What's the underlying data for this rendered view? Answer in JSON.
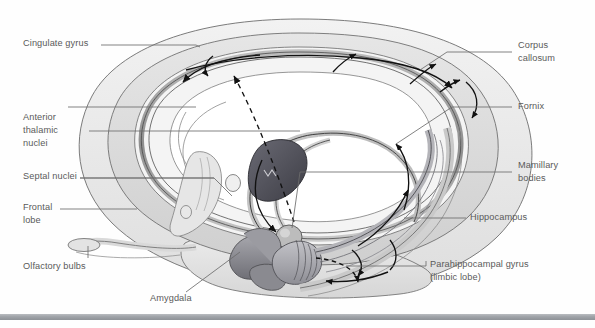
{
  "figure": {
    "background_color": "#fefefe",
    "ink_color": "#5a5a5a",
    "bottom_bar_color": "#9fa3a8"
  },
  "labels": {
    "cingulate_gyrus": "Cingulate gyrus",
    "anterior_thalamic_nuclei_l1": "Anterior",
    "anterior_thalamic_nuclei_l2": "thalamic",
    "anterior_thalamic_nuclei_l3": "nuclei",
    "septal_nuclei": "Septal nuclei",
    "frontal_lobe_l1": "Frontal",
    "frontal_lobe_l2": "lobe",
    "olfactory_bulbs": "Olfactory bulbs",
    "amygdala": "Amygdala",
    "corpus_callosum_l1": "Corpus",
    "corpus_callosum_l2": "callosum",
    "fornix": "Fornix",
    "mamillary_bodies_l1": "Mamillary",
    "mamillary_bodies_l2": "bodies",
    "hippocampus": "Hippocampus",
    "parahippocampal_gyrus_l1": "Parahippocampal gyrus",
    "parahippocampal_gyrus_l2": "(limbic lobe)"
  },
  "structures": [
    {
      "name": "cerebral-hemisphere-outline",
      "shade": "#ececec"
    },
    {
      "name": "cingulate-gyrus-band",
      "shade": "#d8d8d8"
    },
    {
      "name": "corpus-callosum-band",
      "shade": "#9a9a9a"
    },
    {
      "name": "fornix-body",
      "shade": "#bdbdbd"
    },
    {
      "name": "thalamus",
      "shade": "#4e4e56"
    },
    {
      "name": "mamillary-body",
      "shade": "#b6b6b6"
    },
    {
      "name": "septal-nuclei",
      "shade": "#e2e2e2"
    },
    {
      "name": "amygdala",
      "shade": "#8d8d92"
    },
    {
      "name": "hippocampus",
      "shade": "#a9a9ae"
    },
    {
      "name": "parahippocampal-gyrus",
      "shade": "#d2d2d2"
    },
    {
      "name": "olfactory-bulb-tract",
      "shade": "#dcdcdc"
    },
    {
      "name": "temporal-lobe",
      "shade": "#e4e4e4"
    }
  ],
  "pathway_arrows": [
    {
      "name": "cingulum-forward-arrow",
      "direction": "anterior"
    },
    {
      "name": "cingulum-posterior-arrow",
      "direction": "posterior"
    },
    {
      "name": "fornix-to-mamillary-arrow",
      "direction": "inferior"
    },
    {
      "name": "mamillothalamic-tract-arrow",
      "direction": "superior"
    },
    {
      "name": "hippocampus-to-fornix-arrow",
      "direction": "anterior"
    },
    {
      "name": "entorhinal-dashed-arrow",
      "direction": "anterior",
      "style": "dashed"
    }
  ]
}
